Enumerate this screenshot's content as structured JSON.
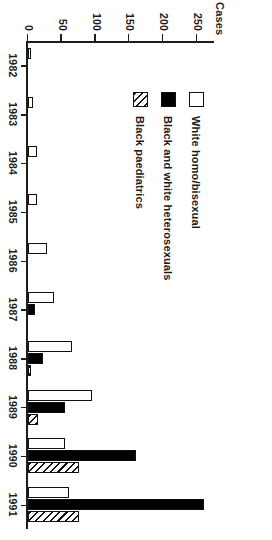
{
  "caption": {
    "text": "Figure 6.1. (b) AIDS in South Africa by Year and Transmission (based on Southall, 1993, p. 63)"
  },
  "legend": {
    "items": [
      {
        "label": "White homo/bisexual",
        "style": "white"
      },
      {
        "label": "Black and white heterosexuals",
        "style": "black"
      },
      {
        "label": "Black paediatrics",
        "style": "hatch"
      }
    ]
  },
  "chart_data": {
    "type": "bar",
    "title": "",
    "xlabel": "",
    "ylabel": "Cases",
    "ylim": [
      0,
      275
    ],
    "yticks": [
      0,
      50,
      100,
      150,
      200,
      250
    ],
    "ytick_labels": [
      "0",
      "50",
      "100",
      "150",
      "200",
      "250"
    ],
    "grid": false,
    "orientation": "horizontal-rotated",
    "legend_position": "upper-left",
    "categories": [
      "1982",
      "1983",
      "1984",
      "1985",
      "1986",
      "1987",
      "1988",
      "1989",
      "1990",
      "1991"
    ],
    "series": [
      {
        "name": "White homo/bisexual",
        "style": "white",
        "values": [
          5,
          8,
          13,
          13,
          28,
          38,
          65,
          95,
          55,
          60
        ]
      },
      {
        "name": "Black and white heterosexuals",
        "style": "black",
        "values": [
          0,
          0,
          0,
          0,
          0,
          10,
          22,
          55,
          160,
          260
        ]
      },
      {
        "name": "Black paediatrics",
        "style": "hatch",
        "values": [
          0,
          0,
          0,
          0,
          0,
          0,
          5,
          15,
          75,
          75
        ]
      }
    ]
  }
}
